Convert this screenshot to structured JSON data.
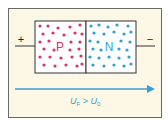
{
  "diagram": {
    "plus_sign": "+",
    "minus_sign": "−",
    "p_region_label": "P",
    "n_region_label": "N",
    "voltage_label": {
      "main": "U",
      "sub_left": "F",
      "operator": " > ",
      "sub_right": "0"
    },
    "colors": {
      "p_carriers": "#d9335f",
      "n_carriers": "#2f9fd6",
      "arrow": "#3aa0cf",
      "background": "#fdf8e6"
    }
  }
}
